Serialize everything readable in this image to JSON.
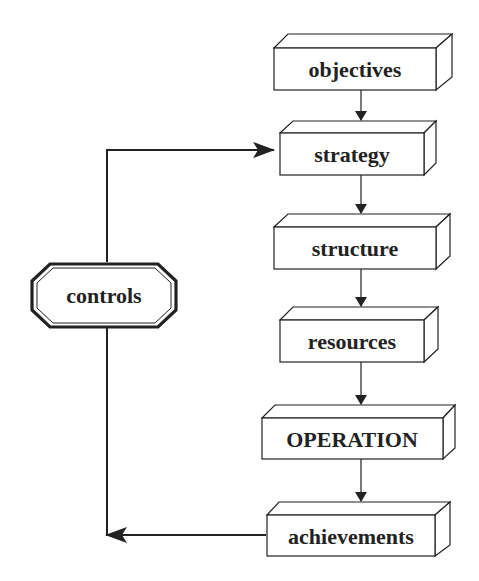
{
  "diagram": {
    "type": "flowchart",
    "nodes": [
      {
        "id": "objectives",
        "label": "objectives"
      },
      {
        "id": "strategy",
        "label": "strategy"
      },
      {
        "id": "structure",
        "label": "structure"
      },
      {
        "id": "resources",
        "label": "resources"
      },
      {
        "id": "operation",
        "label": "OPERATION"
      },
      {
        "id": "achievements",
        "label": "achievements"
      },
      {
        "id": "controls",
        "label": "controls"
      }
    ],
    "edges": [
      {
        "from": "objectives",
        "to": "strategy"
      },
      {
        "from": "strategy",
        "to": "structure"
      },
      {
        "from": "structure",
        "to": "resources"
      },
      {
        "from": "resources",
        "to": "operation"
      },
      {
        "from": "operation",
        "to": "achievements"
      },
      {
        "from": "achievements",
        "to": "controls"
      },
      {
        "from": "controls",
        "to": "strategy"
      }
    ],
    "colors": {
      "stroke": "#222222",
      "fill": "#ffffff",
      "text": "#222222"
    }
  }
}
